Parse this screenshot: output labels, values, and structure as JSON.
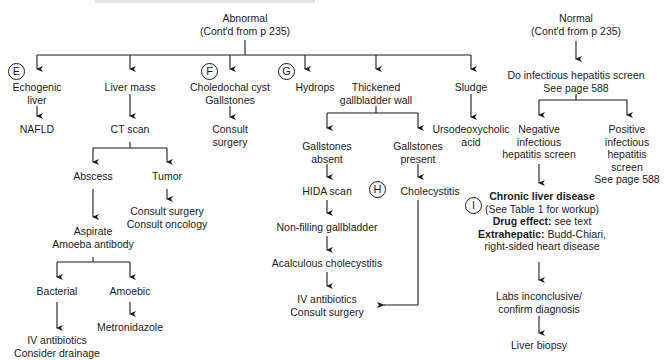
{
  "diagram": {
    "type": "flowchart",
    "roots": {
      "abnormal": {
        "label": "Abnormal",
        "sub": "(Cont'd from p 235)"
      },
      "normal": {
        "label": "Normal",
        "sub": "(Cont'd from p 235)"
      }
    },
    "badges": {
      "E": "E",
      "F": "F",
      "G": "G",
      "H": "H",
      "I": "I"
    },
    "nodes": {
      "echogenic": [
        "Echogenic",
        "liver"
      ],
      "nafld": "NAFLD",
      "liver_mass": "Liver mass",
      "ct_scan": "CT scan",
      "abscess": "Abscess",
      "tumor": "Tumor",
      "tumor_action": [
        "Consult surgery",
        "Consult oncology"
      ],
      "aspirate": [
        "Aspirate",
        "Amoeba antibody"
      ],
      "bacterial": "Bacterial",
      "amoebic": "Amoebic",
      "bacterial_action": [
        "IV antibiotics",
        "Consider drainage"
      ],
      "metronidazole": "Metronidazole",
      "choledochal": [
        "Choledochal cyst",
        "Gallstones"
      ],
      "consult_surgery": [
        "Consult",
        "surgery"
      ],
      "hydrops": "Hydrops",
      "thickened": [
        "Thickened",
        "gallbladder wall"
      ],
      "gs_absent": [
        "Gallstones",
        "absent"
      ],
      "gs_present": [
        "Gallstones",
        "present"
      ],
      "hida": "HIDA scan",
      "cholecystitis": "Cholecystitis",
      "nonfilling": "Non-filling gallbladder",
      "acalculous": "Acalculous cholecystitis",
      "iv_surgery": [
        "IV antibiotics",
        "Consult surgery"
      ],
      "sludge": "Sludge",
      "urso": [
        "Ursodeoxycholic",
        "acid"
      ],
      "screen": [
        "Do infectious hepatitis screen",
        "See page 588"
      ],
      "negative": [
        "Negative",
        "infectious",
        "hepatitis screen"
      ],
      "positive": [
        "Positive",
        "infectious",
        "hepatitis",
        "screen",
        "See page 588"
      ],
      "chronic": {
        "title": "Chronic liver disease",
        "sub": "(See Table 1 for workup)",
        "drug_bold": "Drug effect:",
        "drug_text": " see text",
        "extra_bold": "Extrahepatic:",
        "extra_text": " Budd-Chiari,",
        "extra_line2": "right-sided heart disease"
      },
      "labs": [
        "Labs inconclusive/",
        "confirm diagnosis"
      ],
      "biopsy": "Liver biopsy"
    }
  }
}
